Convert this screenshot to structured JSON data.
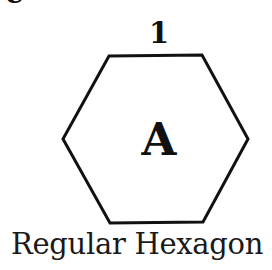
{
  "diagram": {
    "clipped_glyph": "e",
    "side_label": "1",
    "area_label": "A",
    "caption": "Regular Hexagon",
    "shape": "hexagon",
    "vertices": [
      [
        109,
        56
      ],
      [
        202,
        55
      ],
      [
        248,
        139
      ],
      [
        203,
        222
      ],
      [
        110,
        223
      ],
      [
        63,
        139
      ]
    ],
    "stroke_color": "#111111",
    "fill_color": "#ffffff"
  }
}
